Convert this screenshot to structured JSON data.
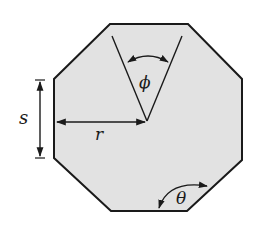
{
  "diagram": {
    "colors": {
      "fill": "#e2e2e2",
      "stroke": "#1a1a1a",
      "background": "#ffffff"
    },
    "labels": {
      "side": "s",
      "radius": "r",
      "central_angle": "ϕ",
      "interior_angle": "θ"
    },
    "vertices": [
      [
        110,
        24
      ],
      [
        188,
        24
      ],
      [
        242,
        79
      ],
      [
        242,
        160
      ],
      [
        187,
        211
      ],
      [
        111,
        211
      ],
      [
        54,
        158
      ],
      [
        54,
        79
      ]
    ],
    "center": [
      147,
      121
    ]
  }
}
